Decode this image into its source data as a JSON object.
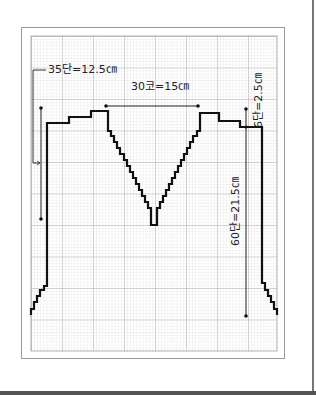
{
  "diagram": {
    "type": "knitting-chart",
    "colors": {
      "background": "#ffffff",
      "frame": "#9a9a9a",
      "grid_minor": "#d6d6d6",
      "grid_major": "#9e9e9e",
      "outline": "#111111",
      "measure_line": "#222222"
    },
    "labels": {
      "left_height": "35단=12.5㎝",
      "top_width": "30코=15㎝",
      "right_shoulder": "6단=2.5㎝",
      "right_height": "60단=21.5㎝"
    }
  }
}
